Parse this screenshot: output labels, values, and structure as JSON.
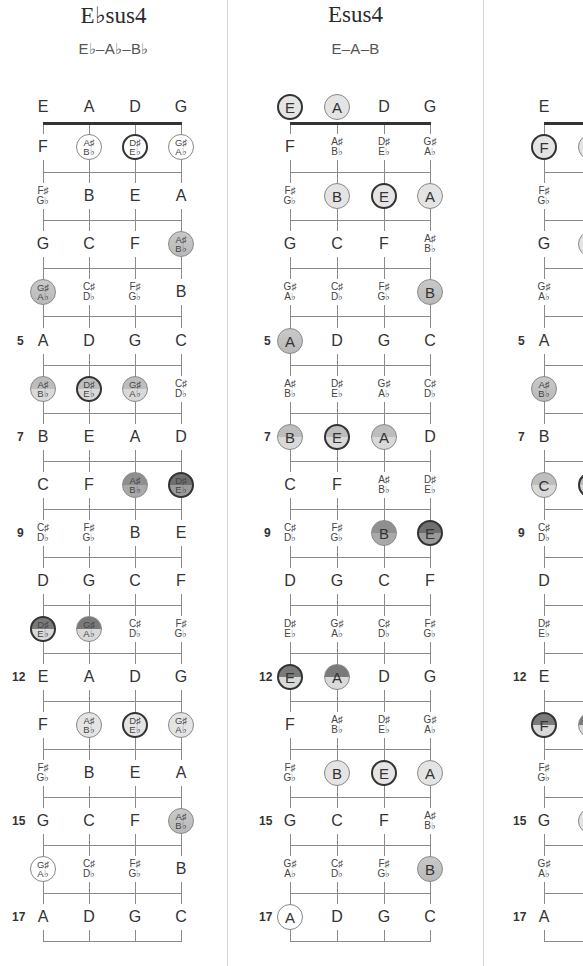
{
  "panels": [
    {
      "id": "ebsus4",
      "title": "E♭sus4",
      "notes": "E♭–A♭–B♭",
      "strings_x": [
        43,
        89,
        135,
        181
      ],
      "offset_x": 0,
      "rows": [
        {
          "fret": "",
          "cells": [
            {
              "t": "E"
            },
            {
              "t": "A"
            },
            {
              "t": "D"
            },
            {
              "t": "G"
            }
          ]
        },
        {
          "fret": "",
          "cells": [
            {
              "t": "F"
            },
            {
              "t": "A♯|B♭",
              "s": "circ f-white"
            },
            {
              "t": "D♯|E♭",
              "s": "circ bold f-white"
            },
            {
              "t": "G♯|A♭",
              "s": "circ f-white"
            }
          ]
        },
        {
          "fret": "",
          "cells": [
            {
              "t": "F♯|G♭"
            },
            {
              "t": "B"
            },
            {
              "t": "E"
            },
            {
              "t": "A"
            }
          ]
        },
        {
          "fret": "",
          "cells": [
            {
              "t": "G"
            },
            {
              "t": "C"
            },
            {
              "t": "F"
            },
            {
              "t": "A♯|B♭",
              "s": "circ f-mid"
            }
          ]
        },
        {
          "fret": "",
          "cells": [
            {
              "t": "G♯|A♭",
              "s": "circ f-mid"
            },
            {
              "t": "C♯|D♭"
            },
            {
              "t": "F♯|G♭"
            },
            {
              "t": "B"
            }
          ]
        },
        {
          "fret": "5",
          "cells": [
            {
              "t": "A"
            },
            {
              "t": "D"
            },
            {
              "t": "G"
            },
            {
              "t": "C"
            }
          ]
        },
        {
          "fret": "",
          "cells": [
            {
              "t": "A♯|B♭",
              "s": "circ f-midgrad"
            },
            {
              "t": "D♯|E♭",
              "s": "circ bold f-midgrad"
            },
            {
              "t": "G♯|A♭",
              "s": "circ f-midgrad"
            },
            {
              "t": "C♯|D♭"
            }
          ]
        },
        {
          "fret": "7",
          "cells": [
            {
              "t": "B"
            },
            {
              "t": "E"
            },
            {
              "t": "A"
            },
            {
              "t": "D"
            }
          ]
        },
        {
          "fret": "",
          "cells": [
            {
              "t": "C"
            },
            {
              "t": "F"
            },
            {
              "t": "A♯|B♭",
              "s": "circ f-dark"
            },
            {
              "t": "D♯|E♭",
              "s": "circ bold f-darker"
            }
          ]
        },
        {
          "fret": "9",
          "cells": [
            {
              "t": "C♯|D♭"
            },
            {
              "t": "F♯|G♭"
            },
            {
              "t": "B"
            },
            {
              "t": "E"
            }
          ]
        },
        {
          "fret": "",
          "cells": [
            {
              "t": "D"
            },
            {
              "t": "G"
            },
            {
              "t": "C"
            },
            {
              "t": "F"
            }
          ]
        },
        {
          "fret": "",
          "cells": [
            {
              "t": "D♯|E♭",
              "s": "circ bold f-split"
            },
            {
              "t": "G♯|A♭",
              "s": "circ f-split"
            },
            {
              "t": "C♯|D♭"
            },
            {
              "t": "F♯|G♭"
            }
          ]
        },
        {
          "fret": "12",
          "cells": [
            {
              "t": "E"
            },
            {
              "t": "A"
            },
            {
              "t": "D"
            },
            {
              "t": "G"
            }
          ]
        },
        {
          "fret": "",
          "cells": [
            {
              "t": "F"
            },
            {
              "t": "A♯|B♭",
              "s": "circ f-light"
            },
            {
              "t": "D♯|E♭",
              "s": "circ bold f-light"
            },
            {
              "t": "G♯|A♭",
              "s": "circ f-light"
            }
          ]
        },
        {
          "fret": "",
          "cells": [
            {
              "t": "F♯|G♭"
            },
            {
              "t": "B"
            },
            {
              "t": "E"
            },
            {
              "t": "A"
            }
          ]
        },
        {
          "fret": "15",
          "cells": [
            {
              "t": "G"
            },
            {
              "t": "C"
            },
            {
              "t": "F"
            },
            {
              "t": "A♯|B♭",
              "s": "circ f-mid"
            }
          ]
        },
        {
          "fret": "",
          "cells": [
            {
              "t": "G♯|A♭",
              "s": "circ f-white"
            },
            {
              "t": "C♯|D♭"
            },
            {
              "t": "F♯|G♭"
            },
            {
              "t": "B"
            }
          ]
        },
        {
          "fret": "17",
          "cells": [
            {
              "t": "A"
            },
            {
              "t": "D"
            },
            {
              "t": "G"
            },
            {
              "t": "C"
            }
          ]
        }
      ]
    },
    {
      "id": "esus4",
      "title": "Esus4",
      "notes": "E–A–B",
      "strings_x": [
        290,
        337,
        384,
        430
      ],
      "offset_x": 0,
      "rows": [
        {
          "fret": "",
          "cells": [
            {
              "t": "E",
              "s": "circ bold f-light"
            },
            {
              "t": "A",
              "s": "circ f-light"
            },
            {
              "t": "D"
            },
            {
              "t": "G"
            }
          ]
        },
        {
          "fret": "",
          "cells": [
            {
              "t": "F"
            },
            {
              "t": "A♯|B♭"
            },
            {
              "t": "D♯|E♭"
            },
            {
              "t": "G♯|A♭"
            }
          ]
        },
        {
          "fret": "",
          "cells": [
            {
              "t": "F♯|G♭"
            },
            {
              "t": "B",
              "s": "circ f-light"
            },
            {
              "t": "E",
              "s": "circ bold f-light"
            },
            {
              "t": "A",
              "s": "circ f-light"
            }
          ]
        },
        {
          "fret": "",
          "cells": [
            {
              "t": "G"
            },
            {
              "t": "C"
            },
            {
              "t": "F"
            },
            {
              "t": "A♯|B♭"
            }
          ]
        },
        {
          "fret": "",
          "cells": [
            {
              "t": "G♯|A♭"
            },
            {
              "t": "C♯|D♭"
            },
            {
              "t": "F♯|G♭"
            },
            {
              "t": "B",
              "s": "circ f-mid"
            }
          ]
        },
        {
          "fret": "5",
          "cells": [
            {
              "t": "A",
              "s": "circ f-mid"
            },
            {
              "t": "D"
            },
            {
              "t": "G"
            },
            {
              "t": "C"
            }
          ]
        },
        {
          "fret": "",
          "cells": [
            {
              "t": "A♯|B♭"
            },
            {
              "t": "D♯|E♭"
            },
            {
              "t": "G♯|A♭"
            },
            {
              "t": "C♯|D♭"
            }
          ]
        },
        {
          "fret": "7",
          "cells": [
            {
              "t": "B",
              "s": "circ f-midgrad"
            },
            {
              "t": "E",
              "s": "circ bold f-midgrad"
            },
            {
              "t": "A",
              "s": "circ f-midgrad"
            },
            {
              "t": "D"
            }
          ]
        },
        {
          "fret": "",
          "cells": [
            {
              "t": "C"
            },
            {
              "t": "F"
            },
            {
              "t": "A♯|B♭"
            },
            {
              "t": "D♯|E♭"
            }
          ]
        },
        {
          "fret": "9",
          "cells": [
            {
              "t": "C♯|D♭"
            },
            {
              "t": "F♯|G♭"
            },
            {
              "t": "B",
              "s": "circ f-dark"
            },
            {
              "t": "E",
              "s": "circ bold f-darker"
            }
          ]
        },
        {
          "fret": "",
          "cells": [
            {
              "t": "D"
            },
            {
              "t": "G"
            },
            {
              "t": "C"
            },
            {
              "t": "F"
            }
          ]
        },
        {
          "fret": "",
          "cells": [
            {
              "t": "D♯|E♭"
            },
            {
              "t": "G♯|A♭"
            },
            {
              "t": "C♯|D♭"
            },
            {
              "t": "F♯|G♭"
            }
          ]
        },
        {
          "fret": "12",
          "cells": [
            {
              "t": "E",
              "s": "circ bold f-split"
            },
            {
              "t": "A",
              "s": "circ f-split"
            },
            {
              "t": "D"
            },
            {
              "t": "G"
            }
          ]
        },
        {
          "fret": "",
          "cells": [
            {
              "t": "F"
            },
            {
              "t": "A♯|B♭"
            },
            {
              "t": "D♯|E♭"
            },
            {
              "t": "G♯|A♭"
            }
          ]
        },
        {
          "fret": "",
          "cells": [
            {
              "t": "F♯|G♭"
            },
            {
              "t": "B",
              "s": "circ f-light"
            },
            {
              "t": "E",
              "s": "circ bold f-light"
            },
            {
              "t": "A",
              "s": "circ f-light"
            }
          ]
        },
        {
          "fret": "15",
          "cells": [
            {
              "t": "G"
            },
            {
              "t": "C"
            },
            {
              "t": "F"
            },
            {
              "t": "A♯|B♭"
            }
          ]
        },
        {
          "fret": "",
          "cells": [
            {
              "t": "G♯|A♭"
            },
            {
              "t": "C♯|D♭"
            },
            {
              "t": "F♯|G♭"
            },
            {
              "t": "B",
              "s": "circ f-mid"
            }
          ]
        },
        {
          "fret": "17",
          "cells": [
            {
              "t": "A",
              "s": "circ f-white"
            },
            {
              "t": "D"
            },
            {
              "t": "G"
            },
            {
              "t": "C"
            }
          ]
        }
      ]
    },
    {
      "id": "fsus4-partial",
      "title": "",
      "notes": "",
      "strings_x": [
        544,
        591,
        638,
        685
      ],
      "offset_x": 0,
      "rows": [
        {
          "fret": "",
          "cells": [
            {
              "t": "E"
            },
            {
              "t": ""
            },
            {
              "t": ""
            },
            {
              "t": ""
            }
          ]
        },
        {
          "fret": "",
          "cells": [
            {
              "t": "F",
              "s": "circ bold f-light"
            },
            {
              "t": "",
              "s": "circ f-light"
            },
            {
              "t": ""
            },
            {
              "t": ""
            }
          ]
        },
        {
          "fret": "",
          "cells": [
            {
              "t": "F♯|G♭"
            },
            {
              "t": ""
            },
            {
              "t": ""
            },
            {
              "t": ""
            }
          ]
        },
        {
          "fret": "",
          "cells": [
            {
              "t": "G"
            },
            {
              "t": "",
              "s": "circ f-light"
            },
            {
              "t": ""
            },
            {
              "t": ""
            }
          ]
        },
        {
          "fret": "",
          "cells": [
            {
              "t": "G♯|A♭"
            },
            {
              "t": ""
            },
            {
              "t": ""
            },
            {
              "t": ""
            }
          ]
        },
        {
          "fret": "5",
          "cells": [
            {
              "t": "A"
            },
            {
              "t": ""
            },
            {
              "t": ""
            },
            {
              "t": ""
            }
          ]
        },
        {
          "fret": "",
          "cells": [
            {
              "t": "A♯|B♭",
              "s": "circ f-mid"
            },
            {
              "t": ""
            },
            {
              "t": ""
            },
            {
              "t": ""
            }
          ]
        },
        {
          "fret": "7",
          "cells": [
            {
              "t": "B"
            },
            {
              "t": ""
            },
            {
              "t": ""
            },
            {
              "t": ""
            }
          ]
        },
        {
          "fret": "",
          "cells": [
            {
              "t": "C",
              "s": "circ f-midgrad"
            },
            {
              "t": "",
              "s": "circ bold f-midgrad"
            },
            {
              "t": ""
            },
            {
              "t": ""
            }
          ]
        },
        {
          "fret": "9",
          "cells": [
            {
              "t": "C♯|D♭"
            },
            {
              "t": ""
            },
            {
              "t": ""
            },
            {
              "t": ""
            }
          ]
        },
        {
          "fret": "",
          "cells": [
            {
              "t": "D"
            },
            {
              "t": ""
            },
            {
              "t": ""
            },
            {
              "t": ""
            }
          ]
        },
        {
          "fret": "",
          "cells": [
            {
              "t": "D♯|E♭"
            },
            {
              "t": ""
            },
            {
              "t": ""
            },
            {
              "t": ""
            }
          ]
        },
        {
          "fret": "12",
          "cells": [
            {
              "t": "E"
            },
            {
              "t": ""
            },
            {
              "t": ""
            },
            {
              "t": ""
            }
          ]
        },
        {
          "fret": "",
          "cells": [
            {
              "t": "F",
              "s": "circ bold f-split"
            },
            {
              "t": "",
              "s": "circ f-split"
            },
            {
              "t": ""
            },
            {
              "t": ""
            }
          ]
        },
        {
          "fret": "",
          "cells": [
            {
              "t": "F♯|G♭"
            },
            {
              "t": ""
            },
            {
              "t": ""
            },
            {
              "t": ""
            }
          ]
        },
        {
          "fret": "15",
          "cells": [
            {
              "t": "G"
            },
            {
              "t": "",
              "s": "circ f-light"
            },
            {
              "t": ""
            },
            {
              "t": ""
            }
          ]
        },
        {
          "fret": "",
          "cells": [
            {
              "t": "G♯|A♭"
            },
            {
              "t": ""
            },
            {
              "t": ""
            },
            {
              "t": ""
            }
          ]
        },
        {
          "fret": "17",
          "cells": [
            {
              "t": "A"
            },
            {
              "t": ""
            },
            {
              "t": ""
            },
            {
              "t": ""
            }
          ]
        }
      ]
    }
  ],
  "layout": {
    "row_y": [
      107,
      147,
      196,
      244,
      292,
      341,
      389,
      437,
      485,
      533,
      581,
      629,
      677,
      725,
      773,
      821,
      869,
      917
    ],
    "fret_y": [
      124,
      172,
      220,
      268,
      316,
      365,
      413,
      461,
      509,
      557,
      605,
      653,
      701,
      749,
      797,
      845,
      893,
      941
    ],
    "nut_y": 123,
    "dividers_x": [
      227,
      483
    ]
  }
}
